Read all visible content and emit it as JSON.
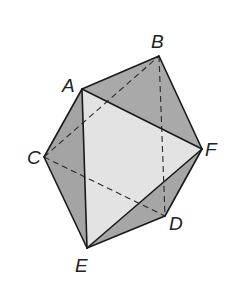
{
  "figure": {
    "type": "octahedron",
    "vertices": {
      "A": {
        "label": "A",
        "x": 82,
        "y": 89,
        "label_x": 62,
        "label_y": 92
      },
      "B": {
        "label": "B",
        "x": 159,
        "y": 56,
        "label_x": 151,
        "label_y": 48
      },
      "C": {
        "label": "C",
        "x": 44,
        "y": 157,
        "label_x": 27,
        "label_y": 164
      },
      "D": {
        "label": "D",
        "x": 165,
        "y": 216,
        "label_x": 169,
        "label_y": 230
      },
      "E": {
        "label": "E",
        "x": 87,
        "y": 248,
        "label_x": 75,
        "label_y": 272
      },
      "F": {
        "label": "F",
        "x": 202,
        "y": 149,
        "label_x": 205,
        "label_y": 156
      }
    },
    "faces": [
      {
        "name": "face-abf",
        "vertices": [
          "A",
          "B",
          "F"
        ],
        "fill": "#a9a9a9"
      },
      {
        "name": "face-ace",
        "vertices": [
          "A",
          "C",
          "E"
        ],
        "fill": "#a4a4a4"
      },
      {
        "name": "face-edf",
        "vertices": [
          "E",
          "D",
          "F"
        ],
        "fill": "#a6a6a6"
      },
      {
        "name": "face-aef",
        "vertices": [
          "A",
          "E",
          "F"
        ],
        "fill": "#e3e3e3"
      }
    ],
    "solid_edges": [
      [
        "A",
        "B"
      ],
      [
        "B",
        "F"
      ],
      [
        "A",
        "F"
      ],
      [
        "A",
        "C"
      ],
      [
        "C",
        "E"
      ],
      [
        "A",
        "E"
      ],
      [
        "E",
        "F"
      ],
      [
        "E",
        "D"
      ],
      [
        "D",
        "F"
      ]
    ],
    "dashed_edges": [
      [
        "C",
        "B"
      ],
      [
        "C",
        "D"
      ],
      [
        "B",
        "D"
      ]
    ]
  }
}
